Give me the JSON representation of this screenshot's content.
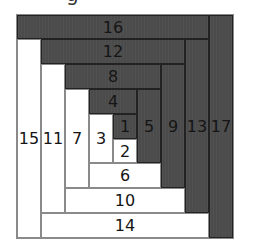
{
  "caption_fragment": "g",
  "colors": {
    "dark": "#4b4b4b",
    "light": "#ffffff",
    "line": "#8a8a8a"
  },
  "pieces": [
    {
      "label": "16",
      "shade": "dark",
      "x": 0,
      "y": 0,
      "w": 192,
      "h": 24
    },
    {
      "label": "17",
      "shade": "dark",
      "x": 192,
      "y": 0,
      "w": 24,
      "h": 223
    },
    {
      "label": "12",
      "shade": "dark",
      "x": 24,
      "y": 24,
      "w": 144,
      "h": 25
    },
    {
      "label": "13",
      "shade": "dark",
      "x": 168,
      "y": 24,
      "w": 24,
      "h": 174
    },
    {
      "label": "8",
      "shade": "dark",
      "x": 48,
      "y": 49,
      "w": 96,
      "h": 25
    },
    {
      "label": "9",
      "shade": "dark",
      "x": 144,
      "y": 49,
      "w": 24,
      "h": 124
    },
    {
      "label": "4",
      "shade": "dark",
      "x": 72,
      "y": 74,
      "w": 48,
      "h": 25
    },
    {
      "label": "5",
      "shade": "dark",
      "x": 120,
      "y": 74,
      "w": 24,
      "h": 74
    },
    {
      "label": "1",
      "shade": "dark",
      "x": 96,
      "y": 99,
      "w": 24,
      "h": 25
    },
    {
      "label": "2",
      "shade": "light",
      "x": 96,
      "y": 124,
      "w": 24,
      "h": 24
    },
    {
      "label": "3",
      "shade": "light",
      "x": 72,
      "y": 99,
      "w": 24,
      "h": 49
    },
    {
      "label": "6",
      "shade": "light",
      "x": 72,
      "y": 148,
      "w": 72,
      "h": 25
    },
    {
      "label": "7",
      "shade": "light",
      "x": 48,
      "y": 74,
      "w": 24,
      "h": 99
    },
    {
      "label": "10",
      "shade": "light",
      "x": 48,
      "y": 173,
      "w": 120,
      "h": 25
    },
    {
      "label": "11",
      "shade": "light",
      "x": 24,
      "y": 49,
      "w": 24,
      "h": 149
    },
    {
      "label": "14",
      "shade": "light",
      "x": 24,
      "y": 198,
      "w": 168,
      "h": 25
    },
    {
      "label": "15",
      "shade": "light",
      "x": 0,
      "y": 24,
      "w": 24,
      "h": 199
    }
  ]
}
